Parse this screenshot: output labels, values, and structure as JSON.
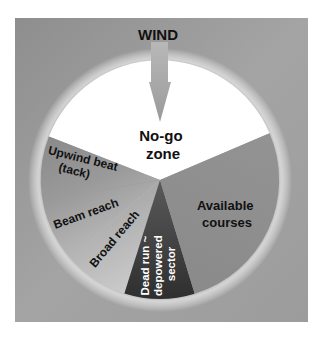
{
  "title": "WIND",
  "colors": {
    "background": "#9a9a9a",
    "no_go": "#ffffff",
    "upwind": "#8c8c8c",
    "beam": "#a8a8a8",
    "broad": "#c4c4c4",
    "dead_run": "#3c3c3c",
    "available": "#888888",
    "arrow": "#a6a6a6"
  },
  "sectors": [
    {
      "id": "no-go",
      "label_line1": "No-go",
      "label_line2": "zone"
    },
    {
      "id": "upwind",
      "label_line1": "Upwind beat",
      "label_line2": "(tack)"
    },
    {
      "id": "beam",
      "label_line1": "Beam reach"
    },
    {
      "id": "broad",
      "label_line1": "Broad reach"
    },
    {
      "id": "dead-run",
      "label_line1": "Dead run ~",
      "label_line2": "depowered",
      "label_line3": "sector"
    },
    {
      "id": "available",
      "label_line1": "Available",
      "label_line2": "courses"
    }
  ]
}
